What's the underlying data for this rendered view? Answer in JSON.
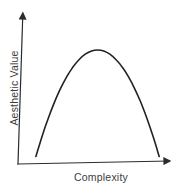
{
  "figure": {
    "background": "#ffffff"
  },
  "colors": {
    "axis": "#2c2c2c",
    "curve": "#222222",
    "text": "#3d3d3d"
  },
  "chart_data": {
    "type": "line",
    "title": "",
    "xlabel": "Complexity",
    "ylabel": "Aesthetic Value",
    "xlim": [
      0,
      1
    ],
    "ylim": [
      0,
      1
    ],
    "ticks": "none",
    "tick_labels": "none",
    "grid": false,
    "legend": "none",
    "axes_style": "arrows",
    "shape": "inverted-U",
    "series": [
      {
        "name": "aesthetic-value-vs-complexity",
        "points": [
          [
            0.115,
            0.05
          ],
          [
            0.155,
            0.187
          ],
          [
            0.194,
            0.305
          ],
          [
            0.234,
            0.413
          ],
          [
            0.273,
            0.504
          ],
          [
            0.313,
            0.583
          ],
          [
            0.352,
            0.646
          ],
          [
            0.392,
            0.697
          ],
          [
            0.431,
            0.732
          ],
          [
            0.471,
            0.753
          ],
          [
            0.51,
            0.76
          ],
          [
            0.55,
            0.753
          ],
          [
            0.589,
            0.732
          ],
          [
            0.629,
            0.695
          ],
          [
            0.668,
            0.646
          ],
          [
            0.708,
            0.582
          ],
          [
            0.747,
            0.504
          ],
          [
            0.787,
            0.411
          ],
          [
            0.826,
            0.305
          ],
          [
            0.866,
            0.183
          ],
          [
            0.905,
            0.05
          ]
        ]
      }
    ]
  }
}
